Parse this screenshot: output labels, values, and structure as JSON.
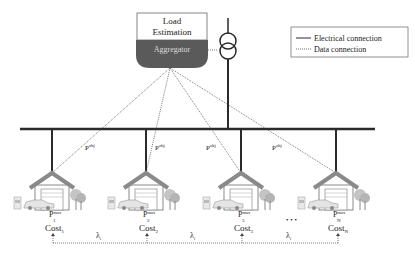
{
  "load_estimation": {
    "line1": "Load",
    "line2": "Estimation"
  },
  "aggregator": {
    "label": "Aggregator"
  },
  "legend": {
    "electrical": "Electrical connection",
    "data": "Data connection"
  },
  "power_labels": {
    "p_obj_base": "P",
    "p_obj_sup": "obj"
  },
  "households": [
    {
      "p_max_base": "P",
      "p_max_sup": "max",
      "p_max_sub": "1",
      "cost_base": "Cost",
      "cost_sub": "1"
    },
    {
      "p_max_base": "P",
      "p_max_sup": "max",
      "p_max_sub": "2",
      "cost_base": "Cost",
      "cost_sub": "2"
    },
    {
      "p_max_base": "P",
      "p_max_sup": "max",
      "p_max_sub": "3",
      "cost_base": "Cost",
      "cost_sub": "3"
    },
    {
      "p_max_base": "P",
      "p_max_sup": "max",
      "p_max_sub": "N",
      "cost_base": "Cost",
      "cost_sub": "N"
    }
  ],
  "lambda": {
    "base": "λ",
    "sub": "i"
  },
  "ellipsis": "• • •",
  "colors": {
    "line": "#2a2a2a",
    "aggregator_fill": "#5a5a5a",
    "house_roof": "#8a8a8a",
    "house_wall": "#ffffff",
    "tree": "#b8b8b8"
  }
}
